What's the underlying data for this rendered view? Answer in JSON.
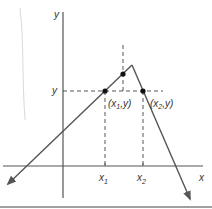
{
  "figure": {
    "colors": {
      "line": "#555555",
      "dash": "#444444",
      "point": "#111111",
      "rule": "#444444",
      "margin": "#cccccc"
    },
    "axes": {
      "x_label": "x",
      "y_label": "y",
      "origin": [
        63,
        166
      ]
    },
    "labels": {
      "y_level": "y",
      "x1": {
        "main": "x",
        "sub": "1"
      },
      "x2": {
        "main": "x",
        "sub": "2"
      },
      "p1": {
        "pre": "(x",
        "sub": "1",
        "post": ",y)"
      },
      "p2": {
        "pre": "(x",
        "sub": "2",
        "post": ",y)"
      }
    },
    "points": {
      "p1": [
        105,
        91
      ],
      "p2": [
        143,
        91
      ],
      "mid": [
        123,
        74
      ],
      "peak": [
        132,
        65
      ]
    }
  }
}
